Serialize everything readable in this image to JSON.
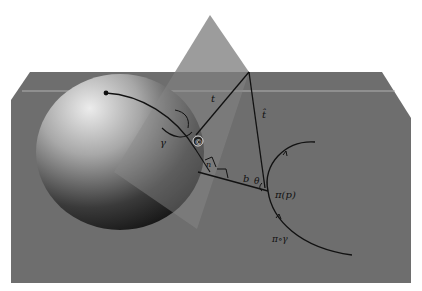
{
  "diagram": {
    "colors": {
      "background": "#ffffff",
      "ground_plane": "#6e6e6e",
      "plane_highlight_line": "#b4b4b4",
      "triangle_plane": "#9a9a9a",
      "sphere_light": "#e6e6e6",
      "sphere_dark": "#1c1c1c",
      "ink": "#111111"
    },
    "labels": {
      "t": "t",
      "t_hat": "t̂",
      "gamma": "γ",
      "circled_point": "©",
      "small_n": "n",
      "h": "h",
      "b": "b",
      "theta": "θ",
      "pi_p": "π(p)",
      "pi_gamma": "π∘γ"
    }
  }
}
